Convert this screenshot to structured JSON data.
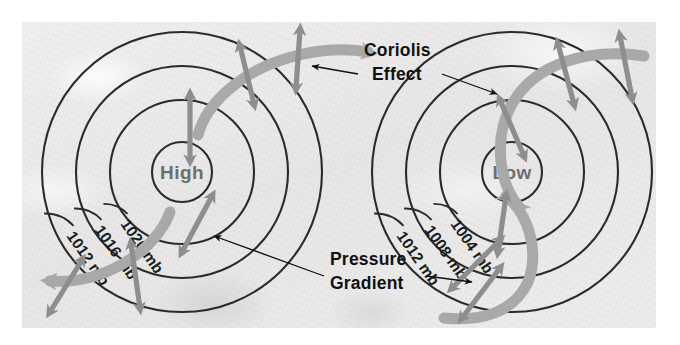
{
  "figure": {
    "background_color": "#eceaea",
    "frame_color": "#ffffff"
  },
  "colors": {
    "isobar_line": "#2b2b2b",
    "wind_arrow": "#a9a9a9",
    "force_arrow": "#8e8e8e",
    "leader_line": "#111111",
    "center_label": "#6e6e6e",
    "callout_label": "#111111"
  },
  "callouts": [
    {
      "id": "coriolis",
      "line1": "Coriolis",
      "line2": "Effect",
      "name": "coriolis-effect-label"
    },
    {
      "id": "gradient",
      "line1": "Pressure",
      "line2": "Gradient",
      "name": "pressure-gradient-label"
    }
  ],
  "systems": [
    {
      "id": "high",
      "center_label": "High",
      "center": {
        "x": 182,
        "y": 172
      },
      "radii": [
        30,
        72,
        106,
        140
      ],
      "isobars": [
        {
          "value": "1020 mb",
          "ring": 1
        },
        {
          "value": "1016 mb",
          "ring": 2
        },
        {
          "value": "1012 mb",
          "ring": 3
        }
      ]
    },
    {
      "id": "low",
      "center_label": "Low",
      "center": {
        "x": 512,
        "y": 172
      },
      "radii": [
        30,
        72,
        106,
        140
      ],
      "isobars": [
        {
          "value": "1004 mb",
          "ring": 1
        },
        {
          "value": "1008 mb",
          "ring": 2
        },
        {
          "value": "1012 mb",
          "ring": 3
        }
      ]
    }
  ]
}
